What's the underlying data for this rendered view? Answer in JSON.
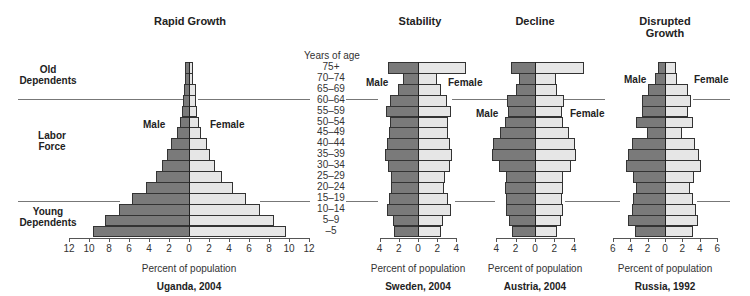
{
  "chart_data": [
    {
      "type": "bar",
      "subtype": "population-pyramid",
      "title": "Rapid Growth",
      "caption": "Uganda, 2004",
      "xlabel": "Percent of population",
      "ylabel": "Years of age",
      "xlim": [
        -12,
        12
      ],
      "xticks": [
        12,
        10,
        8,
        6,
        4,
        2,
        0,
        2,
        4,
        6,
        8,
        10,
        12
      ],
      "categories": [
        "75+",
        "70–74",
        "65–69",
        "60–64",
        "55–59",
        "50–54",
        "45–49",
        "40–44",
        "35–39",
        "30–34",
        "25–29",
        "20–24",
        "15–19",
        "10–14",
        "5–9",
        "–5"
      ],
      "series": [
        {
          "name": "Male",
          "values": [
            0.4,
            0.4,
            0.5,
            0.6,
            0.7,
            0.9,
            1.2,
            1.8,
            2.2,
            2.7,
            3.3,
            4.3,
            5.7,
            7.0,
            8.4,
            9.6
          ]
        },
        {
          "name": "Female",
          "values": [
            0.4,
            0.4,
            0.7,
            0.7,
            0.8,
            1.0,
            1.2,
            1.8,
            2.1,
            2.6,
            3.3,
            4.4,
            5.7,
            7.1,
            8.5,
            9.7
          ]
        }
      ],
      "annotations": [
        "Old Dependents",
        "Labor Force",
        "Young Dependents",
        "Male",
        "Female"
      ]
    },
    {
      "type": "bar",
      "subtype": "population-pyramid",
      "title": "Stability",
      "caption": "Sweden, 2004",
      "xlabel": "Percent of population",
      "xlim": [
        -4,
        4
      ],
      "xticks": [
        4,
        2,
        0,
        2,
        4
      ],
      "categories": [
        "75+",
        "70–74",
        "65–69",
        "60–64",
        "55–59",
        "50–54",
        "45–49",
        "40–44",
        "35–39",
        "30–34",
        "25–29",
        "20–24",
        "15–19",
        "10–14",
        "5–9",
        "–5"
      ],
      "series": [
        {
          "name": "Male",
          "values": [
            3.1,
            1.6,
            2.1,
            2.9,
            3.3,
            2.9,
            3.0,
            3.2,
            3.4,
            3.1,
            2.8,
            2.8,
            3.0,
            3.2,
            2.6,
            2.5
          ]
        },
        {
          "name": "Female",
          "values": [
            5.0,
            2.0,
            2.4,
            3.0,
            3.4,
            3.1,
            3.1,
            3.3,
            3.5,
            3.3,
            2.8,
            2.7,
            3.1,
            3.4,
            2.6,
            2.4
          ]
        }
      ]
    },
    {
      "type": "bar",
      "subtype": "population-pyramid",
      "title": "Decline",
      "caption": "Austria, 2004",
      "xlabel": "Percent of population",
      "xlim": [
        -4,
        4
      ],
      "xticks": [
        4,
        2,
        0,
        2,
        4
      ],
      "categories": [
        "75+",
        "70–74",
        "65–69",
        "60–64",
        "55–59",
        "50–54",
        "45–49",
        "40–44",
        "35–39",
        "30–34",
        "25–29",
        "20–24",
        "15–19",
        "10–14",
        "5–9",
        "–5"
      ],
      "series": [
        {
          "name": "Male",
          "values": [
            2.5,
            1.7,
            2.0,
            2.9,
            2.8,
            3.1,
            3.6,
            4.3,
            4.4,
            3.7,
            3.0,
            3.1,
            3.0,
            3.0,
            2.7,
            2.4
          ]
        },
        {
          "name": "Female",
          "values": [
            5.1,
            2.2,
            2.3,
            3.0,
            2.8,
            2.9,
            3.5,
            4.1,
            4.2,
            3.7,
            2.9,
            2.9,
            2.8,
            2.9,
            2.7,
            2.3
          ]
        }
      ]
    },
    {
      "type": "bar",
      "subtype": "population-pyramid",
      "title": "Disrupted Growth",
      "caption": "Russia, 1992",
      "xlabel": "Percent of population",
      "xlim": [
        -6,
        6
      ],
      "xticks": [
        6,
        4,
        2,
        0,
        2,
        4,
        6
      ],
      "categories": [
        "75+",
        "70–74",
        "65–69",
        "60–64",
        "55–59",
        "50–54",
        "45–49",
        "40–44",
        "35–39",
        "30–34",
        "25–29",
        "20–24",
        "15–19",
        "10–14",
        "5–9",
        "–5"
      ],
      "series": [
        {
          "name": "Male",
          "values": [
            0.8,
            1.1,
            1.9,
            2.7,
            2.7,
            3.3,
            2.1,
            3.8,
            4.3,
            4.5,
            3.7,
            3.3,
            3.7,
            3.8,
            4.2,
            3.5
          ]
        },
        {
          "name": "Female",
          "values": [
            1.3,
            1.4,
            2.6,
            3.0,
            2.6,
            3.2,
            1.9,
            3.5,
            3.9,
            4.1,
            3.3,
            2.9,
            3.2,
            3.6,
            3.8,
            3.2
          ]
        }
      ]
    }
  ],
  "labels": {
    "years_of_age": "Years of age",
    "male": "Male",
    "female": "Female",
    "percent": "Percent of population",
    "old_dependents_1": "Old",
    "old_dependents_2": "Dependents",
    "labor_force_1": "Labor",
    "labor_force_2": "Force",
    "young_dependents_1": "Young",
    "young_dependents_2": "Dependents",
    "disrupted_1": "Disrupted",
    "disrupted_2": "Growth"
  },
  "colors": {
    "male": "#7a7a7a",
    "female": "#e6e6e6",
    "outline": "#333333"
  }
}
